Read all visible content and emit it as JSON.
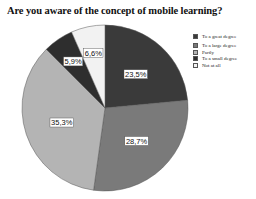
{
  "chart_data": {
    "type": "pie",
    "title": "Are you aware of the concept of mobile learning?",
    "categories": [
      "To a great degree",
      "To a large degree",
      "Partly",
      "To a small degree",
      "Not at all"
    ],
    "values": [
      23.5,
      28.7,
      35.3,
      5.9,
      6.6
    ],
    "labels": [
      "23,5%",
      "28,7%",
      "35,3%",
      "5,9%",
      "6,6%"
    ],
    "colors": [
      "#3a3a3a",
      "#7a7a7a",
      "#b4b4b4",
      "#2e2e2e",
      "#f2f2f2"
    ],
    "legend_position": "right",
    "start_angle": "12 o'clock, clockwise"
  }
}
